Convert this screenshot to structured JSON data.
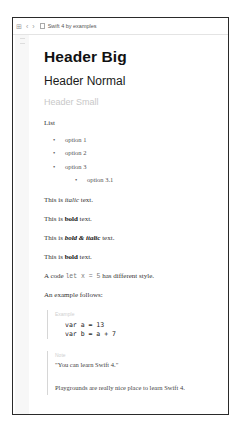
{
  "toolbar": {
    "grid_icon": "⊞",
    "back_icon": "‹",
    "forward_icon": "›",
    "title": "Swift 4 by examples"
  },
  "document": {
    "header_big": "Header Big",
    "header_normal": "Header Normal",
    "header_small": "Header Small",
    "list_label": "List",
    "list_items": [
      "option 1",
      "option 2",
      "option 3"
    ],
    "sub_list_items": [
      "option 3.1"
    ],
    "italic_line": {
      "pre": "This is ",
      "em": "italic",
      "post": " text."
    },
    "bold_line": {
      "pre": "This is ",
      "strong": "bold",
      "post": " text."
    },
    "bold_italic_line": {
      "pre": "This is ",
      "strong_em": "bold & italic",
      "post": " text."
    },
    "bold_line_2": {
      "pre": "This is ",
      "strong": "bold",
      "post": " text."
    },
    "code_line": {
      "pre": "A code ",
      "code": "let x = 5",
      "post": " has different style."
    },
    "example_intro": "An example follows:",
    "example_block": {
      "label": "Example",
      "code_lines": [
        "var a = 13",
        "var b = a + 7"
      ]
    },
    "note_block": {
      "label": "Note",
      "quote": "\"You can learn Swift 4.\"",
      "text": "Playgrounds are really nice place to learn Swift 4."
    }
  }
}
